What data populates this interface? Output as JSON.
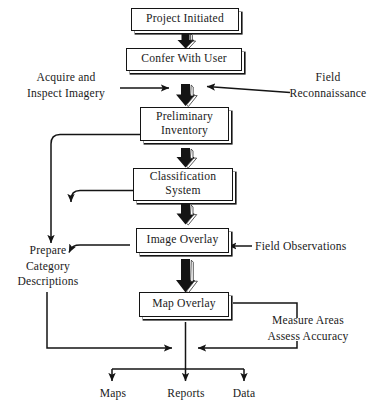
{
  "diagram": {
    "ink_color": "#141414",
    "paper_color": "#ffffff",
    "boxes": [
      {
        "id": "project_initiated",
        "lines": [
          "Project Initiated"
        ]
      },
      {
        "id": "confer_with_user",
        "lines": [
          "Confer With User"
        ]
      },
      {
        "id": "preliminary_inventory",
        "lines": [
          "Preliminary",
          "Inventory"
        ]
      },
      {
        "id": "classification_system",
        "lines": [
          "Classification",
          "System"
        ]
      },
      {
        "id": "image_overlay",
        "lines": [
          "Image Overlay"
        ]
      },
      {
        "id": "map_overlay",
        "lines": [
          "Map Overlay"
        ]
      }
    ],
    "side_labels": [
      {
        "id": "acquire_inspect",
        "lines": [
          "Acquire and",
          "Inspect Imagery"
        ]
      },
      {
        "id": "field_reconnaissance",
        "lines": [
          "Field",
          "Reconnaissance"
        ]
      },
      {
        "id": "field_observations",
        "lines": [
          "Field Observations"
        ]
      },
      {
        "id": "prepare_category",
        "lines": [
          "Prepare",
          "Category",
          "Descriptions"
        ]
      },
      {
        "id": "measure_assess",
        "lines": [
          "Measure Areas",
          "Assess Accuracy"
        ]
      }
    ],
    "outputs": [
      {
        "id": "maps",
        "label": "Maps"
      },
      {
        "id": "reports",
        "label": "Reports"
      },
      {
        "id": "data",
        "label": "Data"
      }
    ]
  }
}
